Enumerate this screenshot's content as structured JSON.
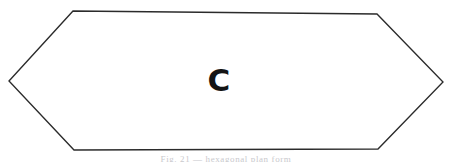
{
  "figure": {
    "name": "elongated-hexagon",
    "label": "C",
    "caption_partial": "Fig. 21 — hexagonal plan form",
    "canvas": {
      "width": 452,
      "height": 162,
      "background_color": "#ffffff"
    },
    "style": {
      "stroke_color": "#2b2b2b",
      "stroke_width": 1.35,
      "fill_color": "#ffffff",
      "label_color": "#141414",
      "label_font_size": 31,
      "caption_color": "#c9c9cd"
    },
    "label_position": {
      "x": 219,
      "y": 91
    },
    "vertices": [
      {
        "name": "left-apex",
        "x": 9,
        "y": 81
      },
      {
        "name": "top-left-corner",
        "x": 73,
        "y": 11
      },
      {
        "name": "top-right-corner",
        "x": 377,
        "y": 14
      },
      {
        "name": "right-apex",
        "x": 443,
        "y": 82
      },
      {
        "name": "bottom-right-corner",
        "x": 378,
        "y": 149
      },
      {
        "name": "bottom-left-corner",
        "x": 74,
        "y": 150
      }
    ],
    "path": "M 9 81 L 73 11 L 377 14 L 443 82 L 378 149 L 74 150 Z"
  }
}
